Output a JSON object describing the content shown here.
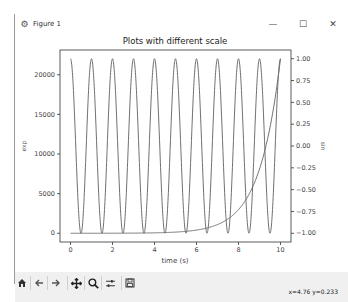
{
  "window": {
    "title": "Figure 1",
    "controls": {
      "minimize": "—",
      "maximize": "☐",
      "close": "✕"
    }
  },
  "toolbar": {
    "buttons": [
      {
        "name": "home",
        "icon": "home-icon"
      },
      {
        "name": "back",
        "icon": "arrow-left-icon"
      },
      {
        "name": "forward",
        "icon": "arrow-right-icon"
      },
      {
        "name": "pan",
        "icon": "move-icon"
      },
      {
        "name": "zoom",
        "icon": "magnifier-icon"
      },
      {
        "name": "configure-subplots",
        "icon": "sliders-icon"
      },
      {
        "name": "save",
        "icon": "floppy-disk-icon"
      }
    ],
    "coordinates": "x=4.76 y=0.233"
  },
  "chart_data": {
    "type": "line",
    "title": "Plots with different scale",
    "xlabel": "time (s)",
    "ylabel_left": "exp",
    "ylabel_right": "sin",
    "xlim": [
      -0.5,
      10.5
    ],
    "xticks": [
      0,
      2,
      4,
      6,
      8,
      10
    ],
    "xtick_labels": [
      "0",
      "2",
      "4",
      "6",
      "8",
      "10"
    ],
    "ylim_left": [
      -1101,
      23127
    ],
    "yticks_left": [
      0,
      5000,
      10000,
      15000,
      20000
    ],
    "ytick_labels_left": [
      "0",
      "5000",
      "10000",
      "15000",
      "20000"
    ],
    "ylim_right": [
      -1.1,
      1.1
    ],
    "yticks_right": [
      -1.0,
      -0.75,
      -0.5,
      -0.25,
      0.0,
      0.25,
      0.5,
      0.75,
      1.0
    ],
    "ytick_labels_right": [
      "−1.00",
      "−0.75",
      "−0.50",
      "−0.25",
      "0.00",
      "0.25",
      "0.50",
      "0.75",
      "1.00"
    ],
    "grid": false,
    "legend": null,
    "series": [
      {
        "name": "exp",
        "axis": "left",
        "formula": "exp(t)",
        "x": [
          0,
          1,
          2,
          3,
          4,
          5,
          6,
          7,
          8,
          9,
          10
        ],
        "values": [
          1,
          2.72,
          7.39,
          20.1,
          54.6,
          148.4,
          403.4,
          1096.6,
          2981.0,
          8103.1,
          22026.5
        ]
      },
      {
        "name": "sin",
        "axis": "right",
        "formula": "sin(2*pi*t + pi/2)",
        "x": [
          0,
          0.25,
          0.5,
          0.75,
          1,
          1.5,
          2,
          2.5,
          3,
          3.5,
          4,
          4.5,
          5,
          5.5,
          6,
          6.5,
          7,
          7.5,
          8,
          8.5,
          9,
          9.5,
          10
        ],
        "values": [
          1,
          0,
          -1,
          0,
          1,
          -1,
          1,
          -1,
          1,
          -1,
          1,
          -1,
          1,
          -1,
          1,
          -1,
          1,
          -1,
          1,
          -1,
          1,
          -1,
          1
        ]
      }
    ],
    "colors": {
      "line": "#707070",
      "axes": "#333333",
      "text": "#444444"
    }
  }
}
